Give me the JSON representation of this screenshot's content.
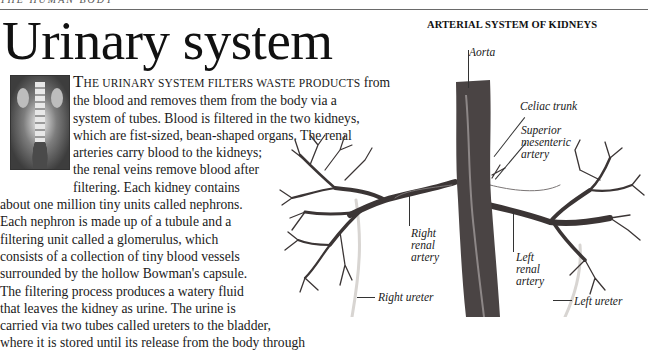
{
  "page": {
    "running_head": "THE HUMAN BODY",
    "title": "Urinary system"
  },
  "thumbnail": {
    "icon": "xray-image-icon",
    "description": "X-ray of urinary tract"
  },
  "body": {
    "lead_cap": "T",
    "lead_smallcaps": "HE URINARY SYSTEM FILTERS WASTE PRODUCTS",
    "lines": [
      " from",
      "the blood and removes them from the body via a",
      "system of tubes. Blood is filtered in the two kidneys,",
      "which are fist-sized, bean-shaped organs. The renal",
      "arteries carry blood to the kidneys;",
      "the renal veins remove blood after",
      "filtering. Each kidney contains",
      "about one million tiny units called nephrons.",
      "Each nephron is made up of a tubule and a",
      "filtering unit called a glomerulus, which",
      "consists of a collection of tiny blood vessels",
      "surrounded by the hollow Bowman's capsule.",
      "The filtering process produces a watery fluid",
      "that leaves the kidney as urine. The urine is",
      "carried via two tubes called ureters to the bladder,",
      "where it is stored until its release from the body through"
    ]
  },
  "figure": {
    "title": "ARTERIAL SYSTEM OF KIDNEYS",
    "labels": {
      "aorta": "Aorta",
      "celiac_trunk": "Celiac trunk",
      "superior_mesenteric": [
        "Superior",
        "mesenteric",
        "artery"
      ],
      "right_renal_artery": [
        "Right",
        "renal",
        "artery"
      ],
      "left_renal_artery": [
        "Left",
        "renal",
        "artery"
      ],
      "right_ureter": "Right ureter",
      "left_ureter": "Left ureter"
    },
    "colors": {
      "vessel": "#3b3535",
      "aorta": "#4a4444",
      "ureter": "#d9d6d3"
    }
  }
}
